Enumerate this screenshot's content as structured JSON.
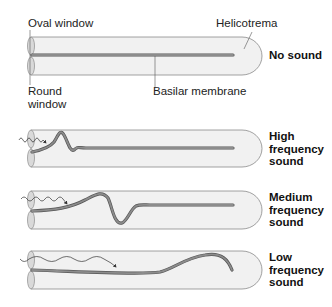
{
  "labels": {
    "oval_window": "Oval window",
    "round_window": "Round\nwindow",
    "helicotrema": "Helicotrema",
    "basilar_membrane": "Basilar membrane"
  },
  "conditions": [
    {
      "id": "none",
      "label": "No sound"
    },
    {
      "id": "high",
      "label": "High\nfrequency\nsound"
    },
    {
      "id": "medium",
      "label": "Medium\nfrequency\nsound"
    },
    {
      "id": "low",
      "label": "Low\nfrequency\nsound"
    }
  ],
  "colors": {
    "tube_fill": "#f1f1f1",
    "tube_stroke": "#8a8a8a",
    "membrane": "#7f7f7f",
    "membrane_edge": "#555555",
    "window_fill": "#d9d9d9",
    "text": "#222222"
  }
}
